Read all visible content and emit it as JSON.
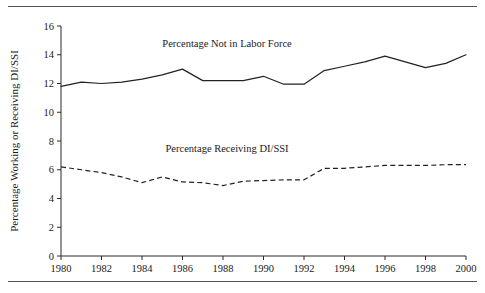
{
  "figure": {
    "clipped_caption_above": "gure 1. Percentage Working or Receiving DI/SSI",
    "rule_color": "#555555",
    "background": "#ffffff",
    "ink_color": "#222222"
  },
  "chart_data": {
    "type": "line",
    "title": "",
    "xlabel": "",
    "ylabel": "Percentage Working or Receiving DI/SSI",
    "xlim": [
      1980,
      2000
    ],
    "ylim": [
      0,
      16
    ],
    "ytick_values": [
      0,
      2,
      4,
      6,
      8,
      10,
      12,
      14,
      16
    ],
    "ytick_labels": [
      "0",
      "2",
      "4",
      "6",
      "8",
      "10",
      "12",
      "14",
      "16"
    ],
    "xtick_values": [
      1980,
      1982,
      1984,
      1986,
      1988,
      1990,
      1992,
      1994,
      1996,
      1998,
      2000
    ],
    "xtick_labels": [
      "1980",
      "1982",
      "1984",
      "1986",
      "1988",
      "1990",
      "1992",
      "1994",
      "1996",
      "1998",
      "2000"
    ],
    "grid": false,
    "legend_position": "inline-annotations",
    "x": [
      1980,
      1981,
      1982,
      1983,
      1984,
      1985,
      1986,
      1987,
      1988,
      1989,
      1990,
      1991,
      1992,
      1993,
      1994,
      1995,
      1996,
      1997,
      1998,
      1999,
      2000
    ],
    "series": [
      {
        "name": "Percentage Not in Labor Force",
        "style": "solid",
        "color": "#222222",
        "label_x": 1988.2,
        "label_y": 14.55,
        "values": [
          11.8,
          12.1,
          12.0,
          12.1,
          12.3,
          12.6,
          13.0,
          12.2,
          12.2,
          12.2,
          12.5,
          11.95,
          11.95,
          12.9,
          13.2,
          13.5,
          13.9,
          13.5,
          13.1,
          13.4,
          14.0
        ]
      },
      {
        "name": "Percentage Receiving DI/SSI",
        "style": "dashed",
        "color": "#222222",
        "label_x": 1988.2,
        "label_y": 7.25,
        "values": [
          6.2,
          6.0,
          5.8,
          5.5,
          5.1,
          5.5,
          5.15,
          5.1,
          4.9,
          5.2,
          5.25,
          5.3,
          5.3,
          6.1,
          6.1,
          6.2,
          6.3,
          6.3,
          6.3,
          6.35,
          6.35
        ]
      }
    ]
  }
}
